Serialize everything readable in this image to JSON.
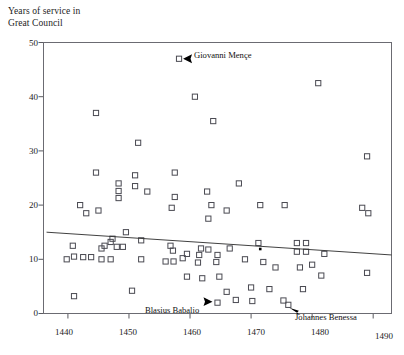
{
  "chart_data": {
    "type": "scatter",
    "title": "",
    "ylabel": "Years of service in\nGreat Council",
    "xlabel": "",
    "xlim": [
      1436,
      1493
    ],
    "ylim": [
      0,
      50
    ],
    "xticks": [
      1440,
      1450,
      1460,
      1470,
      1480,
      1490
    ],
    "xtick_labels": [
      "1440",
      "1450",
      "1460",
      "1470",
      "1480",
      "1490"
    ],
    "yticks": [
      0,
      10,
      20,
      30,
      40,
      50
    ],
    "ytick_labels": [
      "0",
      "10",
      "20",
      "30",
      "40",
      "50"
    ],
    "grid": false,
    "legend": null,
    "marker": "open-square",
    "points": [
      [
        1458.2,
        47.0
      ],
      [
        1481.0,
        42.5
      ],
      [
        1460.8,
        40.0
      ],
      [
        1444.6,
        37.0
      ],
      [
        1463.8,
        35.5
      ],
      [
        1451.5,
        31.5
      ],
      [
        1489.0,
        29.0
      ],
      [
        1444.6,
        26.0
      ],
      [
        1451.0,
        25.5
      ],
      [
        1451.0,
        23.5
      ],
      [
        1457.5,
        26.0
      ],
      [
        1448.3,
        24.0
      ],
      [
        1448.3,
        22.6
      ],
      [
        1448.3,
        21.3
      ],
      [
        1453.0,
        22.5
      ],
      [
        1457.5,
        21.5
      ],
      [
        1457.0,
        19.5
      ],
      [
        1462.8,
        22.5
      ],
      [
        1463.5,
        20.0
      ],
      [
        1463.0,
        17.5
      ],
      [
        1468.0,
        24.0
      ],
      [
        1466.0,
        19.0
      ],
      [
        1471.5,
        20.0
      ],
      [
        1475.5,
        20.0
      ],
      [
        1442.0,
        20.0
      ],
      [
        1445.0,
        19.0
      ],
      [
        1443.0,
        18.5
      ],
      [
        1488.2,
        19.5
      ],
      [
        1489.2,
        18.5
      ],
      [
        1449.5,
        15.0
      ],
      [
        1447.3,
        13.8
      ],
      [
        1447.0,
        13.2
      ],
      [
        1452.0,
        13.5
      ],
      [
        1446.0,
        12.5
      ],
      [
        1445.5,
        12.0
      ],
      [
        1448.0,
        12.3
      ],
      [
        1449.0,
        12.3
      ],
      [
        1471.2,
        13.0
      ],
      [
        1477.5,
        13.0
      ],
      [
        1479.0,
        13.0
      ],
      [
        1477.5,
        11.4
      ],
      [
        1479.0,
        11.4
      ],
      [
        1482.0,
        11.0
      ],
      [
        1440.8,
        12.5
      ],
      [
        1441.0,
        10.5
      ],
      [
        1442.5,
        10.4
      ],
      [
        1443.8,
        10.4
      ],
      [
        1439.8,
        10.0
      ],
      [
        1445.5,
        10.0
      ],
      [
        1447.0,
        10.0
      ],
      [
        1452.0,
        10.0
      ],
      [
        1456.8,
        12.5
      ],
      [
        1457.2,
        11.6
      ],
      [
        1459.5,
        11.0
      ],
      [
        1461.8,
        12.0
      ],
      [
        1461.5,
        10.8
      ],
      [
        1463.0,
        11.8
      ],
      [
        1464.5,
        10.8
      ],
      [
        1466.5,
        12.0
      ],
      [
        1458.8,
        10.2
      ],
      [
        1456.0,
        9.6
      ],
      [
        1457.3,
        9.6
      ],
      [
        1461.3,
        9.4
      ],
      [
        1464.3,
        9.5
      ],
      [
        1469.0,
        10.0
      ],
      [
        1472.0,
        9.5
      ],
      [
        1474.0,
        8.5
      ],
      [
        1478.0,
        8.5
      ],
      [
        1480.0,
        9.0
      ],
      [
        1481.5,
        7.0
      ],
      [
        1489.0,
        7.5
      ],
      [
        1459.5,
        6.8
      ],
      [
        1462.0,
        6.5
      ],
      [
        1464.8,
        6.8
      ],
      [
        1470.0,
        4.8
      ],
      [
        1473.0,
        4.5
      ],
      [
        1478.5,
        4.5
      ],
      [
        1441.0,
        3.2
      ],
      [
        1450.5,
        4.2
      ],
      [
        1466.0,
        4.0
      ],
      [
        1467.5,
        2.5
      ],
      [
        1470.2,
        2.3
      ],
      [
        1464.5,
        2.0
      ],
      [
        1475.3,
        2.4
      ],
      [
        1476.1,
        1.6
      ]
    ],
    "trend_line": {
      "x": [
        1436.5,
        1493
      ],
      "y": [
        15.0,
        10.8
      ],
      "label": ""
    },
    "annotations": [
      {
        "text": "Giovanni Mençe",
        "point": [
          1458.2,
          47.0
        ],
        "arrow_direction": "left"
      },
      {
        "text": "Blasius Babalio",
        "point": [
          1464.5,
          2.0
        ],
        "arrow_direction": "right"
      },
      {
        "text": "Johannes Benessa",
        "point": [
          1476.1,
          1.6
        ],
        "arrow_direction": "up-left"
      }
    ]
  }
}
